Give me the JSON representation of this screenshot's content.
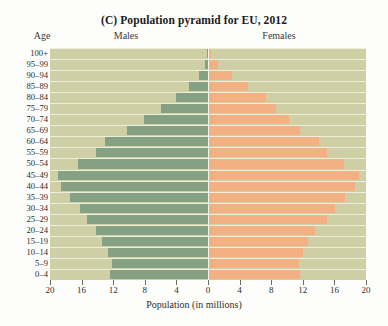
{
  "chart_data": {
    "type": "bar",
    "subtype": "population-pyramid",
    "title": "(C) Population pyramid for EU, 2012",
    "xlabel": "Population (in millions)",
    "ylabel": "Age",
    "xlim": [
      -20,
      20
    ],
    "xticks": [
      20,
      16,
      12,
      8,
      4,
      0,
      4,
      8,
      12,
      16,
      20
    ],
    "grid": true,
    "legend_position": "top",
    "left_header": "Males",
    "right_header": "Females",
    "categories": [
      "100+",
      "95–99",
      "90–94",
      "85–89",
      "80–84",
      "75–79",
      "70–74",
      "65–69",
      "60–64",
      "55–59",
      "50–54",
      "45–49",
      "40–44",
      "35–39",
      "30–34",
      "25–29",
      "20–24",
      "15–19",
      "10–14",
      "5–9",
      "0–4"
    ],
    "series": [
      {
        "name": "Males",
        "color": "#84a183",
        "values": [
          0.1,
          0.4,
          1.1,
          2.4,
          4.1,
          6.0,
          8.1,
          10.3,
          13.0,
          14.2,
          16.4,
          19.0,
          18.6,
          17.5,
          16.2,
          15.3,
          14.2,
          13.4,
          12.6,
          12.1,
          12.4
        ]
      },
      {
        "name": "Females",
        "color": "#f3b083",
        "values": [
          0.4,
          1.3,
          3.0,
          5.1,
          7.3,
          8.6,
          10.2,
          11.6,
          14.1,
          15.0,
          17.2,
          19.1,
          18.6,
          17.4,
          16.1,
          15.0,
          13.6,
          12.7,
          12.0,
          11.5,
          11.7
        ]
      }
    ],
    "colors": {
      "plot_background": "#cfcfa6",
      "gridline": "#f3f3e8",
      "males_bar": "#84a183",
      "females_bar": "#f3b083",
      "page_background": "#fdfdfb"
    }
  }
}
